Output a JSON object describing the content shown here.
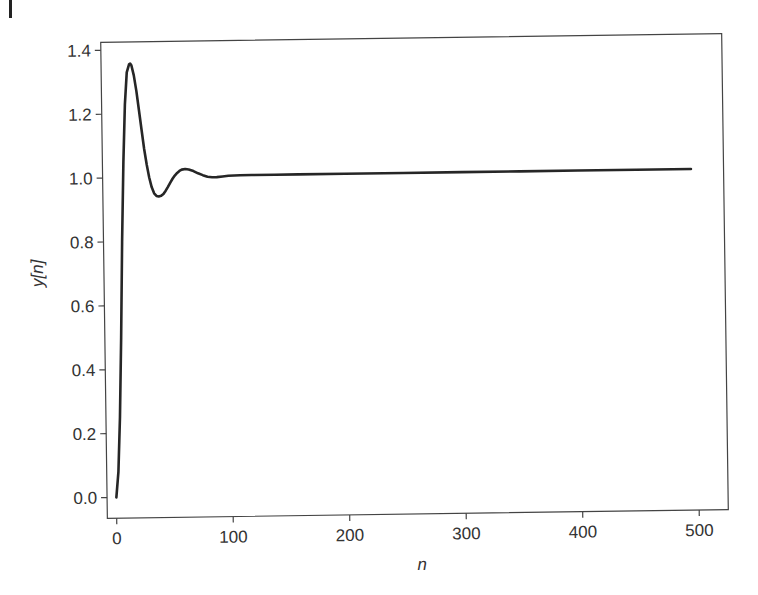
{
  "chart_data": {
    "type": "line",
    "title": "",
    "xlabel": "n",
    "ylabel": "y[n]",
    "xlim": [
      -8,
      525
    ],
    "ylim": [
      -0.065,
      1.425
    ],
    "xticks": [
      0,
      100,
      200,
      300,
      400,
      500
    ],
    "xtick_labels": [
      "0",
      "100",
      "200",
      "300",
      "400",
      "500"
    ],
    "yticks": [
      0.0,
      0.2,
      0.4,
      0.6,
      0.8,
      1.0,
      1.2,
      1.4
    ],
    "ytick_labels": [
      "0.0",
      "0.2",
      "0.4",
      "0.6",
      "0.8",
      "1.0",
      "1.2",
      "1.4"
    ],
    "grid": false,
    "legend": null,
    "line_color": "#262626",
    "series": [
      {
        "name": "y[n]",
        "x": [
          0,
          2,
          4,
          6,
          8,
          10,
          12,
          14,
          16,
          17,
          18,
          20,
          22,
          24,
          26,
          28,
          30,
          32,
          34,
          36,
          38,
          40,
          42,
          44,
          46,
          48,
          50,
          52,
          54,
          56,
          58,
          60,
          63,
          66,
          70,
          74,
          78,
          82,
          86,
          90,
          95,
          100,
          110,
          120,
          140,
          160,
          200,
          250,
          300,
          350,
          400,
          450,
          497
        ],
        "y": [
          0.0,
          0.08,
          0.25,
          0.5,
          0.8,
          1.05,
          1.23,
          1.33,
          1.355,
          1.357,
          1.352,
          1.32,
          1.27,
          1.21,
          1.15,
          1.09,
          1.04,
          1.0,
          0.97,
          0.95,
          0.942,
          0.94,
          0.942,
          0.948,
          0.958,
          0.97,
          0.983,
          0.995,
          1.005,
          1.013,
          1.019,
          1.023,
          1.025,
          1.023,
          1.018,
          1.011,
          1.005,
          1.0,
          0.998,
          0.998,
          1.0,
          1.002,
          1.003,
          1.003,
          1.003,
          1.003,
          1.003,
          1.003,
          1.003,
          1.003,
          1.003,
          1.003,
          1.003
        ]
      }
    ]
  }
}
